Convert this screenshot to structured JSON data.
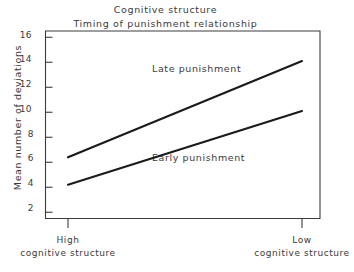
{
  "chart_data": {
    "type": "line",
    "title": "Cognitive structure\nTiming of punishment relationship",
    "title_lines": [
      "Cognitive structure",
      "Timing of punishment relationship"
    ],
    "xlabel": "",
    "ylabel": "Mean number of deviations",
    "categories": [
      "High cognitive structure",
      "Low cognitive structure"
    ],
    "category_lines": [
      [
        "High",
        "cognitive structure"
      ],
      [
        "Low",
        "cognitive structure"
      ]
    ],
    "x": [
      0,
      1
    ],
    "ylim": [
      1.5,
      16.5
    ],
    "yticks": [
      2,
      4,
      6,
      8,
      10,
      12,
      14,
      16
    ],
    "ytick_labels": [
      "2",
      "4",
      "6",
      "8",
      "10",
      "12",
      "14",
      "16"
    ],
    "grid": false,
    "legend_position": "inline-annotations",
    "series": [
      {
        "name": "Late punishment",
        "values": [
          6.4,
          14.1
        ],
        "color": "#1a1a1a",
        "annotation": "Late punishment"
      },
      {
        "name": "Early punishment",
        "values": [
          4.2,
          10.1
        ],
        "color": "#1a1a1a",
        "annotation": "Early punishment"
      }
    ],
    "annotations": [
      "Late punishment",
      "Early punishment"
    ]
  },
  "axis": {
    "ytick_0": "2",
    "ytick_1": "4",
    "ytick_2": "6",
    "ytick_3": "8",
    "ytick_4": "10",
    "ytick_5": "12",
    "ytick_6": "14",
    "ytick_7": "16"
  }
}
